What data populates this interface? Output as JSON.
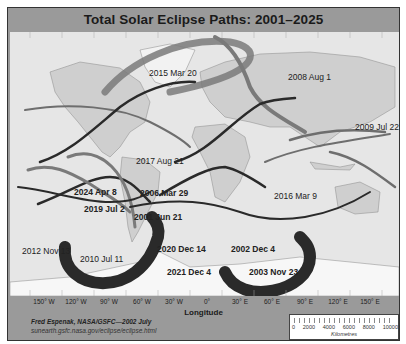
{
  "title": "Total Solar Eclipse Paths:  2001–2025",
  "axis": {
    "title": "Longitude",
    "ticks": [
      "150° W",
      "120° W",
      "90° W",
      "60° W",
      "30° W",
      "0°",
      "30° E",
      "60° E",
      "90° E",
      "120° E",
      "150° E"
    ]
  },
  "credit": {
    "author": "Fred Espenak, NASA/GSFC—2002 July",
    "url": "sunearth.gsfc.nasa.gov/eclipse/eclipse.html"
  },
  "scale": {
    "values": [
      "0",
      "2000",
      "4000",
      "6000",
      "8000",
      "10000"
    ],
    "unit": "Kilometres"
  },
  "eclipses": [
    {
      "label": "2015 Mar 20",
      "bold": false
    },
    {
      "label": "2008 Aug 1",
      "bold": false
    },
    {
      "label": "2017 Aug 21",
      "bold": false
    },
    {
      "label": "2009 Jul 22",
      "bold": false
    },
    {
      "label": "2024 Apr 8",
      "bold": true
    },
    {
      "label": "2006 Mar 29",
      "bold": true
    },
    {
      "label": "2016 Mar 9",
      "bold": false
    },
    {
      "label": "2019 Jul 2",
      "bold": true
    },
    {
      "label": "2001 Jun 21",
      "bold": true
    },
    {
      "label": "2012 Nov 13",
      "bold": false
    },
    {
      "label": "2020 Dec 14",
      "bold": true
    },
    {
      "label": "2002 Dec 4",
      "bold": true
    },
    {
      "label": "2010 Jul 11",
      "bold": false
    },
    {
      "label": "2021 Dec 4",
      "bold": true
    },
    {
      "label": "2003 Nov 23",
      "bold": true
    }
  ],
  "colors": {
    "frame": "#9a9a9a",
    "ocean": "#e6e6e6",
    "land": "#cfcfcf",
    "ice": "#f7f7f7",
    "path_dark": "#2a2a2a",
    "path_gray": "#7a7a7a"
  }
}
